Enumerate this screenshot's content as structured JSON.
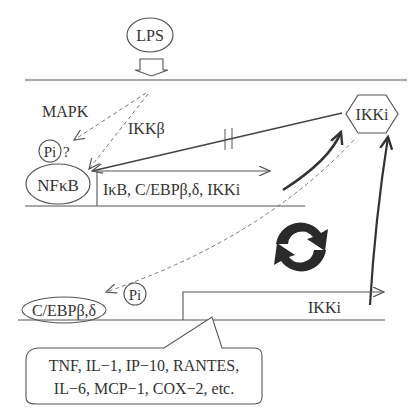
{
  "diagram": {
    "stimulus": {
      "label": "LPS"
    },
    "signals": {
      "mapk": "MAPK",
      "ikkb": "IKKβ",
      "pi_question": "Pi",
      "question_mark": "?"
    },
    "nfkb": {
      "label": "NFκB"
    },
    "nfkb_targets": {
      "label": "IκB, C/EBPβ,δ, IKKi"
    },
    "ikki_node": {
      "label": "IKKi"
    },
    "cebp": {
      "label": "C/EBPβ,δ",
      "pi": "Pi"
    },
    "ikki_gene": {
      "label": "IKKi"
    },
    "callout": {
      "line1": "TNF, IL−1, IP−10, RANTES,",
      "line2": "IL−6, MCP−1, COX−2, etc."
    },
    "colors": {
      "line": "#555555",
      "text": "#333333",
      "cycle": "#2a2a2a"
    }
  }
}
